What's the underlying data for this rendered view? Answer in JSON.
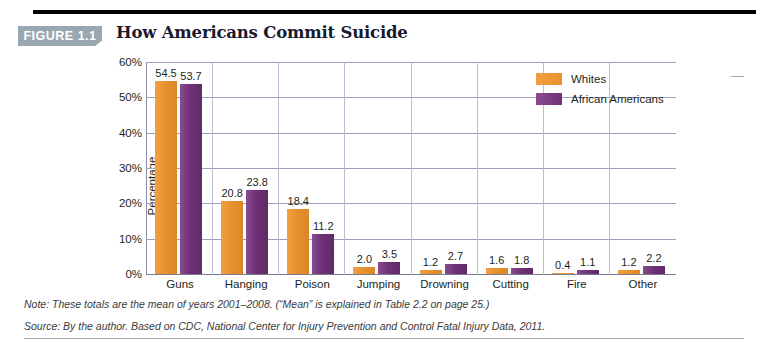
{
  "figure": {
    "badge_label": "FIGURE 1.1",
    "title": "How Americans Commit Suicide"
  },
  "colors": {
    "whites": "#E8922E",
    "african_americans": "#6F3276",
    "badge_bg": "#98A7B0",
    "gridline": "#9AA0C0",
    "rule": "#000000"
  },
  "footnotes": {
    "note": "Note: These totals are the mean of years 2001–2008. (“Mean” is explained in Table 2.2 on page 25.)",
    "source": "Source: By the author. Based on CDC, National Center for Injury Prevention and Control Fatal Injury Data, 2011."
  },
  "chart_data": {
    "type": "bar",
    "title": "How Americans Commit Suicide",
    "xlabel": "",
    "ylabel": "Percentage",
    "ylim": [
      0,
      60
    ],
    "yticks": [
      "0%",
      "10%",
      "20%",
      "30%",
      "40%",
      "50%",
      "60%"
    ],
    "ytick_values": [
      0,
      10,
      20,
      30,
      40,
      50,
      60
    ],
    "grid": true,
    "legend_position": "top-right",
    "categories": [
      "Guns",
      "Hanging",
      "Poison",
      "Jumping",
      "Drowning",
      "Cutting",
      "Fire",
      "Other"
    ],
    "series": [
      {
        "name": "Whites",
        "color": "#E8922E",
        "values": [
          54.5,
          20.8,
          18.4,
          2.0,
          1.2,
          1.6,
          0.4,
          1.2
        ],
        "labels": [
          "54.5",
          "20.8",
          "18.4",
          "2.0",
          "1.2",
          "1.6",
          "0.4",
          "1.2"
        ]
      },
      {
        "name": "African Americans",
        "color": "#6F3276",
        "values": [
          53.7,
          23.8,
          11.2,
          3.5,
          2.7,
          1.8,
          1.1,
          2.2
        ],
        "labels": [
          "53.7",
          "23.8",
          "11.2",
          "3.5",
          "2.7",
          "1.8",
          "1.1",
          "2.2"
        ]
      }
    ]
  }
}
